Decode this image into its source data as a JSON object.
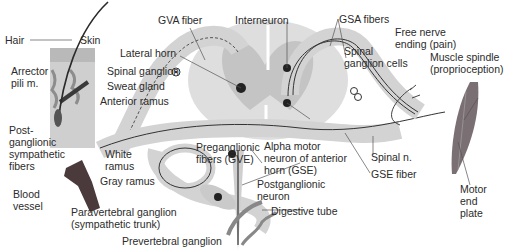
{
  "figure": {
    "labels": {
      "hair": "Hair",
      "skin": "Skin",
      "arrector": "Arrector\npili m.",
      "gva_fiber": "GVA fiber",
      "lateral_horn": "Lateral horn",
      "spinal_ganglion": "Spinal ganglion",
      "sweat_gland": "Sweat gland",
      "anterior_ramus": "Anterior ramus",
      "postganglionic_fibers": "Post-\nganglionic\nsympathetic\nfibers",
      "white_ramus": "White\nramus",
      "gray_ramus": "Gray ramus",
      "blood_vessel": "Blood\nvessel",
      "paravertebral": "Paravertebral ganglion\n(sympathetic trunk)",
      "prevertebral": "Prevertebral ganglion",
      "interneuron": "Interneuron",
      "preganglionic": "Preganglionic\nfibers (GVE)",
      "alpha_motor": "Alpha motor\nneuron of anterior\nhorn (GSE)",
      "postganglionic_neuron": "Postganglionic\nneuron",
      "digestive_tube": "Digestive tube",
      "gsa_fibers": "GSA fibers",
      "spinal_ganglion_cells": "Spinal\nganglion cells",
      "free_nerve_ending": "Free nerve\nending (pain)",
      "muscle_spindle": "Muscle spindle\n(proprioception)",
      "spinal_n": "Spinal n.",
      "gse_fiber": "GSE fiber",
      "motor_end_plate": "Motor\nend\nplate"
    },
    "colors": {
      "tissue": "#d6d6d6",
      "gray_matter": "#c2c2c2",
      "nerve_line": "#2f2f2f",
      "muscle": "#7a6f72",
      "blood_vessel": "#4a3a3c"
    }
  }
}
